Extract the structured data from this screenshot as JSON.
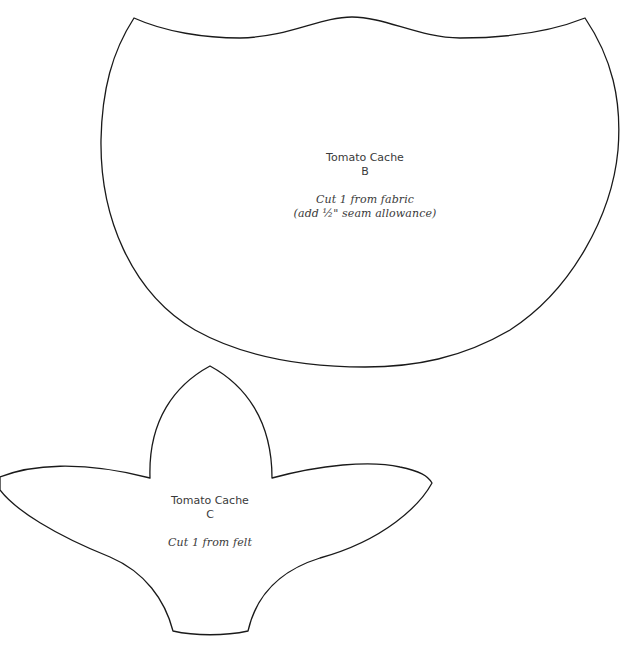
{
  "pieces": [
    {
      "id": "B",
      "title": "Tomato Cache",
      "letter": "B",
      "instructions": [
        "Cut 1 from fabric",
        "(add ½\" seam allowance)"
      ],
      "stroke_color": "#1a1a1a"
    },
    {
      "id": "C",
      "title": "Tomato Cache",
      "letter": "C",
      "instructions": [
        "Cut 1 from felt"
      ],
      "stroke_color": "#1a1a1a"
    }
  ],
  "colors": {
    "background": "#ffffff",
    "outline": "#1a1a1a",
    "text": "#3a3a3a"
  }
}
